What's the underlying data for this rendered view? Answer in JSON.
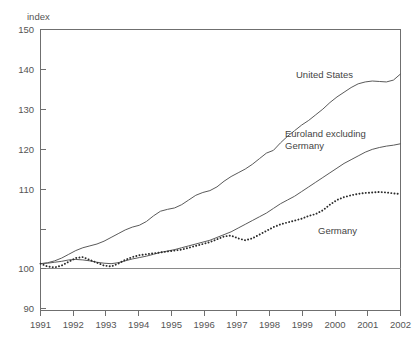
{
  "chart_data": {
    "type": "line",
    "title": "",
    "xlabel": "",
    "ylabel": "index",
    "ylim": [
      90,
      150
    ],
    "xlim": [
      1991,
      2002
    ],
    "yticks": [
      90,
      100,
      110,
      120,
      130,
      140,
      150
    ],
    "xticks": [
      1991,
      1992,
      1993,
      1994,
      1995,
      1996,
      1997,
      1998,
      1999,
      2000,
      2001,
      2002
    ],
    "grid": false,
    "legend_position": "inline-annotations",
    "baseline": 100,
    "x_step_years": 0.25,
    "series": [
      {
        "name": "United States",
        "style": "solid",
        "label_x": 1998.05,
        "label_y": 141.5,
        "values": [
          100.0,
          100.2,
          100.6,
          101.2,
          102.0,
          102.8,
          103.4,
          103.8,
          104.2,
          104.8,
          105.6,
          106.4,
          107.2,
          107.8,
          108.2,
          109.0,
          110.2,
          111.2,
          111.6,
          111.9,
          112.6,
          113.6,
          114.6,
          115.2,
          115.6,
          116.4,
          117.6,
          118.6,
          119.4,
          120.2,
          121.2,
          122.4,
          123.6,
          124.2,
          125.8,
          127.2,
          128.4,
          129.6,
          130.6,
          131.8,
          133.0,
          134.4,
          135.6,
          136.6,
          137.6,
          138.4,
          138.8,
          139.0,
          138.9,
          138.8,
          139.2,
          140.5
        ]
      },
      {
        "name": "Euroland excluding Germany",
        "style": "solid",
        "label_x": 1996.55,
        "label_y": 127.5,
        "label_line2_y": 124.0,
        "values": [
          100.0,
          100.1,
          100.3,
          100.5,
          100.8,
          100.9,
          100.8,
          100.6,
          100.3,
          100.1,
          100.0,
          100.2,
          100.6,
          101.0,
          101.3,
          101.6,
          102.0,
          102.4,
          102.7,
          103.0,
          103.4,
          103.8,
          104.2,
          104.6,
          105.0,
          105.6,
          106.2,
          106.8,
          107.6,
          108.4,
          109.2,
          110.0,
          110.8,
          111.8,
          112.8,
          113.6,
          114.4,
          115.4,
          116.4,
          117.4,
          118.4,
          119.4,
          120.4,
          121.4,
          122.2,
          123.0,
          123.8,
          124.4,
          124.8,
          125.1,
          125.3,
          125.6
        ]
      },
      {
        "name": "Germany",
        "style": "dotted",
        "label_x": 1999.1,
        "label_y": 108.6,
        "values": [
          100.0,
          99.4,
          99.2,
          99.6,
          100.4,
          101.2,
          101.4,
          100.8,
          100.2,
          99.6,
          99.4,
          100.0,
          100.8,
          101.4,
          101.8,
          102.0,
          102.2,
          102.4,
          102.6,
          102.8,
          103.0,
          103.4,
          103.8,
          104.2,
          104.6,
          105.2,
          105.8,
          106.0,
          105.4,
          105.0,
          105.4,
          106.2,
          107.0,
          107.8,
          108.4,
          108.8,
          109.2,
          109.6,
          110.2,
          110.6,
          111.4,
          112.6,
          113.6,
          114.2,
          114.6,
          114.9,
          115.1,
          115.2,
          115.3,
          115.2,
          115.0,
          114.9
        ]
      }
    ]
  },
  "labels": {
    "y_axis_title": "index",
    "us": "United States",
    "euroland_line1": "Euroland excluding",
    "euroland_line2": "Germany",
    "germany": "Germany",
    "ytick_150": "150",
    "ytick_140": "140",
    "ytick_130": "130",
    "ytick_120": "120",
    "ytick_110": "110",
    "ytick_100": "100",
    "ytick_90": "90",
    "xtick_1991": "1991",
    "xtick_1992": "1992",
    "xtick_1993": "1993",
    "xtick_1994": "1994",
    "xtick_1995": "1995",
    "xtick_1996": "1996",
    "xtick_1997": "1997",
    "xtick_1998": "1998",
    "xtick_1999": "1999",
    "xtick_2000": "2000",
    "xtick_2001": "2001",
    "xtick_2002": "2002"
  },
  "colors": {
    "axis": "#6f6f6f",
    "text": "#555555",
    "series_solid": "#5a5a5a",
    "series_dotted": "#2b2b2b",
    "background": "#ffffff"
  }
}
